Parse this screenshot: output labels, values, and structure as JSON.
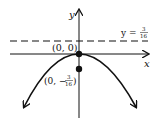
{
  "diagram": {
    "axes": {
      "x_label": "x",
      "y_label": "y"
    },
    "vertex": {
      "label": "(0, 0)"
    },
    "focus": {
      "label_prefix": "(0, −",
      "num": "3",
      "den": "16",
      "label_suffix": ")"
    },
    "directrix": {
      "label_prefix": "y = ",
      "num": "3",
      "den": "16"
    },
    "colors": {
      "ink": "#111111",
      "background": "#ffffff"
    }
  }
}
